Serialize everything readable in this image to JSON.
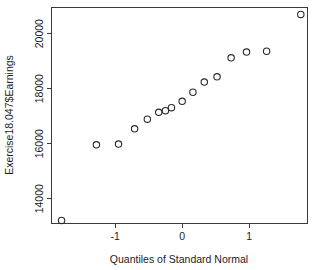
{
  "chart_data": {
    "type": "scatter",
    "title": "",
    "xlabel": "Quantiles of Standard Normal",
    "ylabel": "Exercise18.047$Earnings",
    "xlim": [
      -1.95,
      1.87
    ],
    "ylim": [
      13100,
      20950
    ],
    "xticks": [
      -1,
      0,
      1
    ],
    "xtick_labels": [
      "-1",
      "0",
      "1"
    ],
    "yticks": [
      14000,
      16000,
      18000,
      20000
    ],
    "ytick_labels": [
      "14000",
      "16000",
      "18000",
      "20000"
    ],
    "grid": false,
    "legend": "none",
    "marker": "open-circle",
    "x": [
      -1.8,
      -1.28,
      -0.95,
      -0.71,
      -0.52,
      -0.35,
      -0.25,
      -0.16,
      0.0,
      0.16,
      0.33,
      0.52,
      0.73,
      0.96,
      1.26,
      1.77
    ],
    "y": [
      13210,
      15960,
      15985,
      16540,
      16890,
      17140,
      17200,
      17310,
      17540,
      17870,
      18240,
      18430,
      19120,
      19330,
      19360,
      20700
    ],
    "points": [
      {
        "x": -1.8,
        "y": 13210
      },
      {
        "x": -1.28,
        "y": 15960
      },
      {
        "x": -0.95,
        "y": 15985
      },
      {
        "x": -0.71,
        "y": 16540
      },
      {
        "x": -0.52,
        "y": 16890
      },
      {
        "x": -0.35,
        "y": 17140
      },
      {
        "x": -0.25,
        "y": 17200
      },
      {
        "x": -0.16,
        "y": 17310
      },
      {
        "x": 0.0,
        "y": 17540
      },
      {
        "x": 0.16,
        "y": 17870
      },
      {
        "x": 0.33,
        "y": 18240
      },
      {
        "x": 0.52,
        "y": 18430
      },
      {
        "x": 0.73,
        "y": 19120
      },
      {
        "x": 0.96,
        "y": 19330
      },
      {
        "x": 1.26,
        "y": 19360
      },
      {
        "x": 1.77,
        "y": 20700
      }
    ]
  },
  "style": {
    "axis_color": "#3a3a3a",
    "point_color": "#2b2b2b",
    "text_color": "#1c1c1c",
    "background": "#ffffff",
    "point_radius": 3.2
  }
}
